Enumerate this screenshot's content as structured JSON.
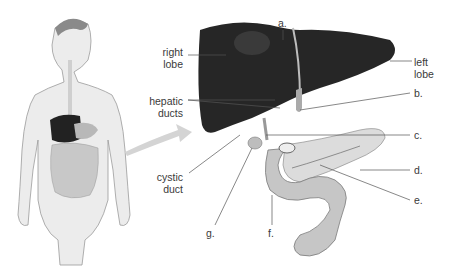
{
  "diagram": {
    "labels": {
      "a": "a.",
      "b": "b.",
      "c": "c.",
      "d": "d.",
      "e": "e.",
      "f": "f.",
      "g": "g.",
      "right_lobe_1": "right",
      "right_lobe_2": "lobe",
      "left_lobe_1": "left",
      "left_lobe_2": "lobe",
      "hepatic_ducts_1": "hepatic",
      "hepatic_ducts_2": "ducts",
      "cystic_duct_1": "cystic",
      "cystic_duct_2": "duct"
    },
    "colors": {
      "liver": "#2a2a2a",
      "pancreas": "#d8d8d8",
      "intestine": "#c4c4c4",
      "skin": "#e8e8e8",
      "leader_line": "#555555",
      "arrow": "#cfcfcf"
    }
  }
}
